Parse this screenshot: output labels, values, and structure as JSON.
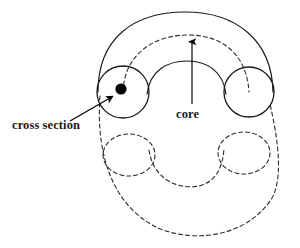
{
  "figure": {
    "name": "torus-cross-section-diagram",
    "background_color": "#ffffff",
    "stroke_color": "#1a1a1a",
    "dash_color": "#2b2b2b",
    "fill_color": "#000000",
    "width": 300,
    "height": 248
  },
  "labels": {
    "cross_section": "cross section",
    "core": "core"
  },
  "annotations": [
    {
      "id": "cross-section",
      "label": "cross section",
      "target": "cross-section-dot",
      "arrow_from": [
        72,
        119
      ],
      "arrow_to": [
        112,
        97
      ],
      "style": "solid"
    },
    {
      "id": "core",
      "label": "core",
      "target": "core-circle",
      "arrow_from": [
        192,
        105
      ],
      "arrow_to": [
        192,
        40
      ],
      "style": "solid"
    }
  ],
  "shapes": {
    "outer_arc_front": {
      "name": "outer-tube-front-arc",
      "style": "solid",
      "description": "upper outer silhouette of the torus"
    },
    "inner_arc_front": {
      "name": "inner-hole-front-arc",
      "style": "solid",
      "description": "front edge of the torus hole"
    },
    "outer_arc_back": {
      "name": "outer-tube-back-arc",
      "style": "dashed",
      "description": "lower outer silhouette of the torus, hidden"
    },
    "inner_arc_back": {
      "name": "inner-hole-back-arc",
      "style": "dashed",
      "description": "rear edge of the torus hole, hidden"
    },
    "core_arc": {
      "name": "core-circle-arc",
      "style": "dashed",
      "description": "central core circle running through the tube"
    },
    "cross_section_circle_left": {
      "name": "cross-section-circle",
      "style": "solid",
      "center": [
        123,
        92
      ],
      "radius": 26
    },
    "cross_section_circle_right": {
      "name": "tube-profile-circle-right",
      "style": "solid",
      "center": [
        249,
        92
      ],
      "radius": 25
    },
    "hidden_circle_lower_left": {
      "name": "hidden-profile-ellipse-left",
      "style": "dashed",
      "center": [
        129,
        155
      ],
      "rx": 26,
      "ry": 21
    },
    "hidden_circle_lower_right": {
      "name": "hidden-profile-ellipse-right",
      "style": "dashed",
      "center": [
        244,
        153
      ],
      "rx": 26,
      "ry": 21
    },
    "core_dot": {
      "name": "cross-section-center-dot",
      "style": "filled",
      "center": [
        121,
        89
      ],
      "radius": 5.5
    }
  }
}
